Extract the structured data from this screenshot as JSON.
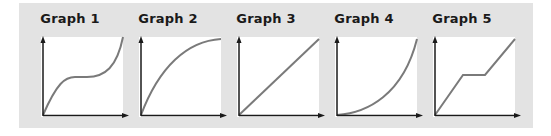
{
  "figure": {
    "background": "#e3e3e3",
    "curve_color": "#7a7a7a",
    "axis_color": "#1a1a1a",
    "graphs": [
      {
        "title": "Graph 1",
        "shape": "cubic-plateau",
        "path": "M0 78 C 14 46, 22 40, 32 40 L 44 40 C 62 40, 74 30, 80 0"
      },
      {
        "title": "Graph 2",
        "shape": "concave-increasing",
        "path": "M0 78 C 18 30, 46 4, 80 2"
      },
      {
        "title": "Graph 3",
        "shape": "linear-increasing",
        "path": "M0 78 L 80 2"
      },
      {
        "title": "Graph 4",
        "shape": "convex-increasing",
        "path": "M0 78 C 30 76, 66 58, 80 2"
      },
      {
        "title": "Graph 5",
        "shape": "piecewise-plateau",
        "path": "M0 78 L 28 38 L 50 38 L 80 2"
      }
    ]
  }
}
